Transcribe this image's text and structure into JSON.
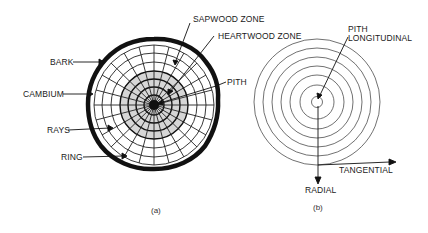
{
  "diagram_a": {
    "caption": "(a)",
    "labels": {
      "sapwood": "SAPWOOD ZONE",
      "heartwood": "HEARTWOOD ZONE",
      "bark": "BARK",
      "cambium": "CAMBIUM",
      "pith": "PITH",
      "rays": "RAYS",
      "ring": "RING"
    }
  },
  "diagram_b": {
    "caption": "(b)",
    "labels": {
      "pith": "PITH",
      "longitudinal": "LONGITUDINAL",
      "tangential": "TANGENTIAL",
      "radial": "RADIAL"
    }
  },
  "colors": {
    "ink": "#111111",
    "heartwood_fill": "#d6d6d6"
  }
}
